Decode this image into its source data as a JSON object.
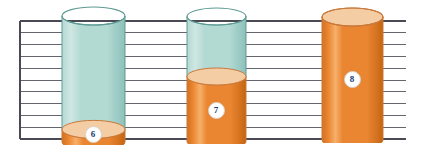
{
  "figure": {
    "kind": "cylinder-fill-illustration",
    "background_color": "#ffffff",
    "width": 423,
    "height": 155
  },
  "grid": {
    "line_color": "#4a4a55",
    "border_color": "#4a4a55",
    "line_count": 11,
    "left": 20,
    "right": 406,
    "top": 21,
    "bottom": 139,
    "spacing": 11.8,
    "left_edge_visible": true
  },
  "palette": {
    "glass_fill": "#b3d9d3",
    "glass_fill_light": "#cfe7e3",
    "glass_edge": "#5e9a93",
    "liquid_orange": "#ea8531",
    "liquid_orange_dark": "#d4721f",
    "liquid_orange_light": "#f6b06a",
    "liquid_surface": "#f5cda4",
    "liquid_surface_edge": "#c9793a",
    "badge_fill": "#ffffff",
    "badge_text": "#173a6d",
    "badge_edge": "#d7d2c8"
  },
  "cylinders": [
    {
      "id": "cylinder-6",
      "label": "6",
      "fill_level_fraction": 0.1,
      "fill_state": "nearly-empty",
      "x": 62,
      "y": 16,
      "width": 63,
      "height": 126,
      "ellipse_ry": 9,
      "badge_cx": 93,
      "badge_cy": 134,
      "badge_r": 8.5,
      "badge_font_size": 9
    },
    {
      "id": "cylinder-7",
      "label": "7",
      "fill_level_fraction": 0.52,
      "fill_state": "half-full",
      "x": 187,
      "y": 16,
      "width": 59,
      "height": 125,
      "ellipse_ry": 8.5,
      "badge_cx": 216,
      "badge_cy": 110,
      "badge_r": 8.5,
      "badge_font_size": 9
    },
    {
      "id": "cylinder-8",
      "label": "8",
      "fill_level_fraction": 1.0,
      "fill_state": "full",
      "x": 322,
      "y": 17,
      "width": 61,
      "height": 123,
      "ellipse_ry": 9,
      "badge_cx": 352,
      "badge_cy": 79,
      "badge_r": 8.5,
      "badge_font_size": 9
    }
  ]
}
